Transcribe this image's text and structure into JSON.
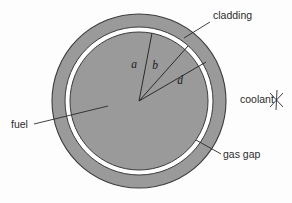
{
  "figure": {
    "background_color": "#fdfdfd"
  },
  "colors": {
    "fuel_fill": "#9a9a9a",
    "cladding_fill": "#9a9a9a",
    "gas_gap_fill": "#ffffff",
    "outline": "#3c3c3c",
    "leader_line": "#2b2b2b",
    "text": "#2b2b2b"
  },
  "geometry": {
    "center_x": 139,
    "center_y": 101,
    "cladding_outer_radius": 87,
    "cladding_inner_radius": 74,
    "gas_gap_outer_radius": 74,
    "gas_gap_inner_radius": 69,
    "fuel_radius": 69
  },
  "regions": [
    {
      "key": "fuel",
      "label": "fuel"
    },
    {
      "key": "gas_gap",
      "label": "gas gap"
    },
    {
      "key": "cladding",
      "label": "cladding"
    },
    {
      "key": "coolant",
      "label": "coolant"
    }
  ],
  "callouts": {
    "cladding": {
      "label": "cladding",
      "text_x": 213,
      "text_y": 19,
      "anchor": "start",
      "leader": {
        "x1": 210,
        "y1": 22,
        "x2": 184,
        "y2": 38
      }
    },
    "coolant": {
      "label": "coolant",
      "text_x": 240,
      "text_y": 103,
      "anchor": "start",
      "marker": {
        "cx": 277,
        "cy": 100,
        "size": 9,
        "name": "coolant-flow-marker"
      }
    },
    "gas_gap": {
      "label": "gas gap",
      "text_x": 223,
      "text_y": 158,
      "anchor": "start",
      "leader": {
        "x1": 221,
        "y1": 154,
        "x2": 196,
        "y2": 140
      }
    },
    "fuel": {
      "label": "fuel",
      "text_x": 11,
      "text_y": 128,
      "anchor": "start",
      "leader": {
        "x1": 34,
        "y1": 124,
        "x2": 108,
        "y2": 106
      }
    }
  },
  "radii": [
    {
      "key": "a",
      "label": "a",
      "line": {
        "x1": 139,
        "y1": 101,
        "x2": 152,
        "y2": 33
      },
      "text_x": 134,
      "text_y": 68
    },
    {
      "key": "b",
      "label": "b",
      "line": {
        "x1": 139,
        "y1": 101,
        "x2": 188,
        "y2": 46
      },
      "text_x": 155,
      "text_y": 69
    },
    {
      "key": "d",
      "label": "d",
      "line": {
        "x1": 139,
        "y1": 101,
        "x2": 206,
        "y2": 62
      },
      "text_x": 180,
      "text_y": 84
    }
  ]
}
